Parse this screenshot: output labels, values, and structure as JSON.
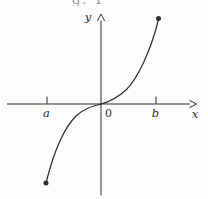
{
  "figure": {
    "caption_fragment": "g. 1",
    "colors": {
      "ink": "#2d2d2d",
      "paper": "#fcfcfa",
      "caption": "#9a9a96"
    },
    "labels": {
      "y_axis": {
        "text": "y",
        "x": 88,
        "y": 21
      },
      "x_axis": {
        "text": "x",
        "x": 195,
        "y": 118
      },
      "origin": {
        "text": "0",
        "x": 108.5,
        "y": 117
      },
      "tick_a": {
        "text": "a",
        "x": 46.5,
        "y": 117
      },
      "tick_b": {
        "text": "b",
        "x": 155.5,
        "y": 117
      }
    },
    "geometry": {
      "x_axis_path": "M7 104 L190 104",
      "x_arrowhead_path": "M189.5 100.4 L196.5 104 L189.5 107.6",
      "y_axis_path": "M101 195.5 L101 20.5",
      "y_arrowhead_path": "M97.4 21 L101 14 L104.6 21",
      "tick_a_path": "M47 96.5 L47 103.8",
      "tick_b_path": "M156 96.5 L156 103.8",
      "curve_path": "M46 183 C53 155 62 130 76 116 C85 108 93 106 101 104 C109 102 116 99 126 90 C138 78 151 50 158.5 19.5",
      "endpoint_lower": {
        "cx": 46,
        "cy": 183,
        "r": 2.5
      },
      "endpoint_upper": {
        "cx": 158.5,
        "cy": 18.5,
        "r": 2.5
      }
    }
  }
}
